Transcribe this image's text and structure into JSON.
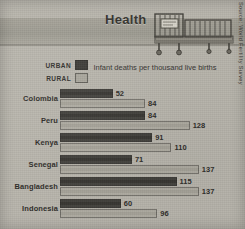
{
  "header": {
    "title": "Health",
    "bed_illustration": "hospital-bed"
  },
  "legend": {
    "items": [
      {
        "label": "URBAN",
        "color": "#3b3a36"
      },
      {
        "label": "RURAL",
        "color": "#a9a69c"
      }
    ]
  },
  "source": "Source: World Fertility Survey",
  "chart_data": {
    "type": "bar",
    "orientation": "horizontal",
    "title": "Infant deaths per thousand live births",
    "xlabel": "",
    "ylabel": "",
    "xlim": [
      0,
      150
    ],
    "grid": false,
    "legend_position": "top-left",
    "categories": [
      "Colombia",
      "Peru",
      "Kenya",
      "Senegal",
      "Bangladesh",
      "Indonesia"
    ],
    "series": [
      {
        "name": "URBAN",
        "color": "#3b3a36",
        "values": [
          52,
          84,
          91,
          71,
          115,
          60
        ]
      },
      {
        "name": "RURAL",
        "color": "#a9a69c",
        "values": [
          84,
          128,
          110,
          137,
          137,
          96
        ]
      }
    ]
  }
}
